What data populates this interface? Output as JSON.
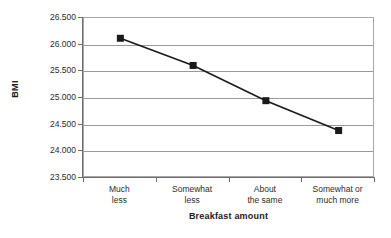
{
  "chart_data": {
    "type": "line",
    "title": "",
    "xlabel": "Breakfast amount",
    "ylabel": "BMI",
    "categories": [
      "Much less",
      "Somewhat less",
      "About the same",
      "Somewhat or much more"
    ],
    "category_lines": [
      [
        "Much",
        "less"
      ],
      [
        "Somewhat",
        "less"
      ],
      [
        "About",
        "the same"
      ],
      [
        "Somewhat or",
        "much more"
      ]
    ],
    "values": [
      26.12,
      25.61,
      24.95,
      24.39
    ],
    "ylim": [
      23.5,
      26.5
    ],
    "ytick_values": [
      26.5,
      26.0,
      25.5,
      25.0,
      24.5,
      24.0,
      23.5
    ],
    "ytick_labels": [
      "26.500",
      "26.000",
      "25.500",
      "25.000",
      "24.500",
      "24.000",
      "23.500"
    ],
    "grid": true,
    "legend": false,
    "series": [
      {
        "name": "BMI",
        "values": [
          26.12,
          25.61,
          24.95,
          24.39
        ],
        "marker": "square",
        "marker_color": "#1a1a1a",
        "line_color": "#1a1a1a"
      }
    ],
    "colors": {
      "line": "#1a1a1a",
      "marker": "#1a1a1a",
      "gridline": "#9a9a9a",
      "axis": "#6e6e6e",
      "plot_border": "#a6a6a6",
      "text": "#2b2b2b",
      "background": "#ffffff"
    }
  }
}
